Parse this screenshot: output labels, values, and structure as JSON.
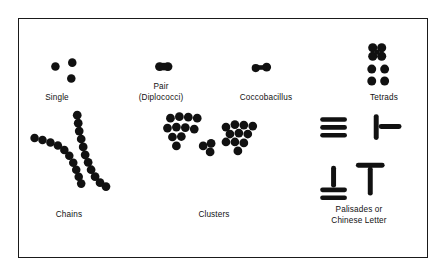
{
  "figure": {
    "kind": "bacterial-cell-arrangements-diagram",
    "background_color": "#ffffff",
    "ink_color": "#111111",
    "border_color": "#1a1a1a",
    "frame": {
      "x": 18,
      "y": 18,
      "width": 410,
      "height": 240
    }
  },
  "groups": [
    {
      "id": "single",
      "label": "Single",
      "label_x": 53,
      "label_y": 98,
      "morphology": "coccus",
      "description": "three separate individual cocci",
      "cells": [
        {
          "type": "coccus",
          "cx": 54,
          "cy": 66,
          "r": 4.2
        },
        {
          "type": "coccus",
          "cx": 71,
          "cy": 62,
          "r": 4.2
        },
        {
          "type": "coccus",
          "cx": 70,
          "cy": 78,
          "r": 4.2
        }
      ]
    },
    {
      "id": "pair",
      "label": "Pair\n(Diplococci)",
      "label_x": 163,
      "label_y": 88,
      "morphology": "coccus",
      "description": "two cocci joined in a pair",
      "cells": [
        {
          "type": "coccus",
          "cx": 159,
          "cy": 66,
          "r": 4.4
        },
        {
          "type": "coccus",
          "cx": 167,
          "cy": 66,
          "r": 4.4
        }
      ]
    },
    {
      "id": "coccobacillus",
      "label": "Coccobacillus",
      "label_x": 264,
      "label_y": 98,
      "morphology": "coccobacillus",
      "description": "short elongated pair, oval rod-like",
      "cells": [
        {
          "type": "coccus",
          "cx": 257,
          "cy": 67,
          "r": 4.0
        },
        {
          "type": "coccus",
          "cx": 266,
          "cy": 66,
          "r": 4.4
        },
        {
          "type": "bridge",
          "cx": 261,
          "cy": 67,
          "w": 10,
          "h": 4
        }
      ]
    },
    {
      "id": "tetrads",
      "label": "Tetrads",
      "label_x": 381,
      "label_y": 98,
      "morphology": "coccus",
      "description": "two groups of four cocci in squares",
      "cells": [
        {
          "type": "coccus",
          "cx": 378,
          "cy": 47,
          "r": 4.3
        },
        {
          "type": "coccus",
          "cx": 387,
          "cy": 47,
          "r": 4.3
        },
        {
          "type": "coccus",
          "cx": 378,
          "cy": 55,
          "r": 4.3
        },
        {
          "type": "coccus",
          "cx": 387,
          "cy": 55,
          "r": 4.3
        },
        {
          "type": "coccus",
          "cx": 377,
          "cy": 68,
          "r": 4.3
        },
        {
          "type": "coccus",
          "cx": 390,
          "cy": 68,
          "r": 4.3
        },
        {
          "type": "coccus",
          "cx": 377,
          "cy": 80,
          "r": 4.3
        },
        {
          "type": "coccus",
          "cx": 390,
          "cy": 80,
          "r": 4.3
        }
      ]
    },
    {
      "id": "chains",
      "label": "Chains",
      "label_x": 60,
      "label_y": 216,
      "morphology": "coccus",
      "description": "two curved chains of cocci (streptococci)",
      "cells": []
    },
    {
      "id": "clusters",
      "label": "Clusters",
      "label_x": 213,
      "label_y": 216,
      "morphology": "coccus",
      "description": "grape-like irregular clusters (staphylococci)",
      "cells": []
    },
    {
      "id": "palisades",
      "label": "Palisades or\nChinese Letter",
      "label_x": 355,
      "label_y": 211,
      "morphology": "bacillus",
      "description": "rods in palisade stacks and angular V / T / L letter forms",
      "cells": []
    }
  ]
}
